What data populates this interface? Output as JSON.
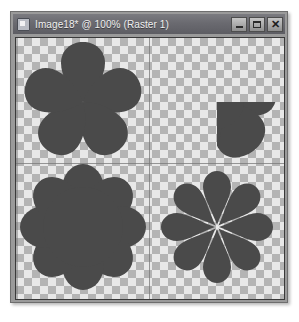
{
  "window": {
    "title": "Image18* @ 100% (Raster 1)",
    "icon": "image-document-icon",
    "controls": {
      "minimize_label": "_",
      "maximize_label": "□",
      "close_label": "✕"
    }
  },
  "canvas": {
    "zoom_level": "100%",
    "layer_name": "Raster 1",
    "background": "transparent-checkerboard",
    "checker_light": "#e8e8e8",
    "checker_dark": "#b4b4b4",
    "shape_color": "#4a4a4a",
    "shapes": [
      {
        "id": "flower-top-left",
        "name": "five-petal-teardrop-flower",
        "petals": 5,
        "center": "closed-pointed",
        "description": "Five broad teardrop petals converging to a single point at the center"
      },
      {
        "id": "flower-top-right",
        "name": "five-petal-ring-flower",
        "petals": 5,
        "center": "hollow-circle",
        "description": "Five rounded petals arranged around a transparent circular hole"
      },
      {
        "id": "flower-bottom-left",
        "name": "eight-petal-solid-flower",
        "petals": 8,
        "center": "solid-filled",
        "description": "Eight rounded petals overlapping a solid filled disc center"
      },
      {
        "id": "flower-bottom-right",
        "name": "eight-petal-spoke-flower",
        "petals": 8,
        "center": "open-spokes",
        "description": "Eight narrow teardrop petals radiating outward with gaps between them"
      }
    ]
  }
}
